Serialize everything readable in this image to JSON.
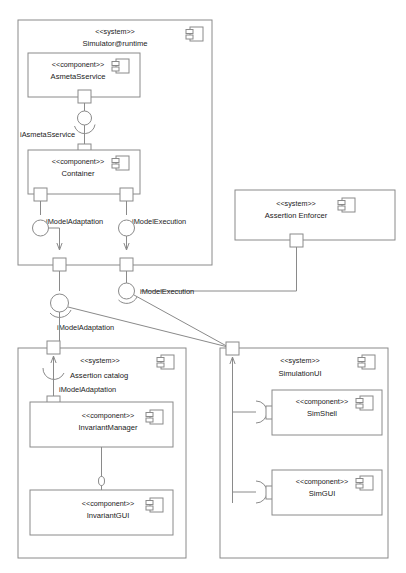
{
  "diagram": {
    "type": "uml-component-diagram",
    "title": "",
    "stroke_color": "#8a8a8a",
    "text_color": "#1a1a1a",
    "background_color": "#ffffff",
    "stereotype_system": "<<system>>",
    "stereotype_component": "<<component>>"
  },
  "systems": [
    {
      "id": "simulator-runtime",
      "stereotype": "<<system>>",
      "name": "Simulator@runtime",
      "components": [
        {
          "id": "asmetas-service",
          "stereotype": "<<component>>",
          "name": "AsmetaSservice"
        },
        {
          "id": "container",
          "stereotype": "<<component>>",
          "name": "Container"
        }
      ]
    },
    {
      "id": "assertion-enforcer",
      "stereotype": "<<system>>",
      "name": "Assertion Enforcer",
      "components": []
    },
    {
      "id": "assertion-catalog",
      "stereotype": "<<system>>",
      "name": "Assertion catalog",
      "components": [
        {
          "id": "invariant-manager",
          "stereotype": "<<component>>",
          "name": "InvariantManager"
        },
        {
          "id": "invariant-gui",
          "stereotype": "<<component>>",
          "name": "InvariantGUI"
        }
      ]
    },
    {
      "id": "simulation-ui",
      "stereotype": "<<system>>",
      "name": "SimulationUI",
      "components": [
        {
          "id": "sim-shell",
          "stereotype": "<<component>>",
          "name": "SimShell"
        },
        {
          "id": "sim-gui",
          "stereotype": "<<component>>",
          "name": "SimGUI"
        }
      ]
    }
  ],
  "interfaces": [
    {
      "id": "iface-asmetas-service",
      "label": "iAsmetaSservice"
    },
    {
      "id": "iface-model-adaptation-container",
      "label": "iModelAdaptation"
    },
    {
      "id": "iface-model-execution-container",
      "label": "iModelExecution"
    },
    {
      "id": "iface-model-execution-outer",
      "label": "iModelExecution"
    },
    {
      "id": "iface-model-adaptation-outer",
      "label": "iModelAdaptation"
    },
    {
      "id": "iface-model-adaptation-catalog",
      "label": "iModelAdaptation"
    }
  ],
  "labels": {
    "simulator_runtime_stereo": "<<system>>",
    "simulator_runtime_name": "Simulator@runtime",
    "asmetas_service_stereo": "<<component>>",
    "asmetas_service_name": "AsmetaSservice",
    "container_stereo": "<<component>>",
    "container_name": "Container",
    "assertion_enforcer_stereo": "<<system>>",
    "assertion_enforcer_name": "Assertion Enforcer",
    "assertion_catalog_stereo": "<<system>>",
    "assertion_catalog_name": "Assertion catalog",
    "invariant_manager_stereo": "<<component>>",
    "invariant_manager_name": "InvariantManager",
    "invariant_gui_stereo": "<<component>>",
    "invariant_gui_name": "InvariantGUI",
    "simulation_ui_stereo": "<<system>>",
    "simulation_ui_name": "SimulationUI",
    "sim_shell_stereo": "<<component>>",
    "sim_shell_name": "SimShell",
    "sim_gui_stereo": "<<component>>",
    "sim_gui_name": "SimGUI",
    "iface_asmetas_service": "iAsmetaSservice",
    "iface_model_adaptation_container": "iModelAdaptation",
    "iface_model_execution_container": "iModelExecution",
    "iface_model_execution_outer": "iModelExecution",
    "iface_model_adaptation_outer": "iModelAdaptation",
    "iface_model_adaptation_catalog": "iModelAdaptation"
  }
}
